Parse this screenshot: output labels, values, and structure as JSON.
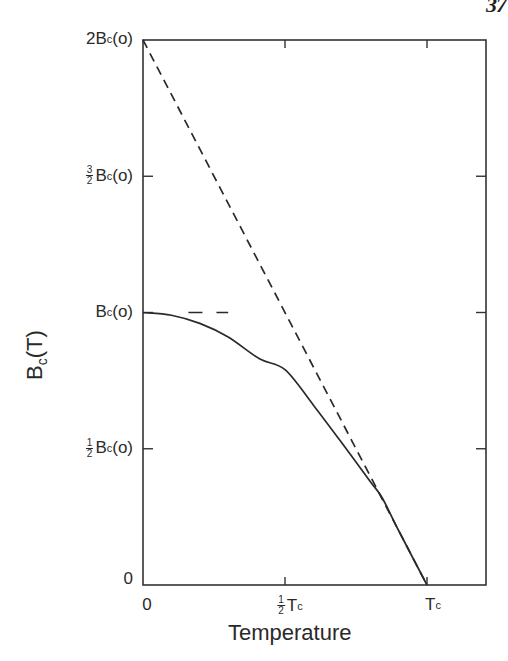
{
  "page": {
    "page_number_partial": "37"
  },
  "chart_data": {
    "type": "line",
    "title": "",
    "xlabel": "Temperature",
    "ylabel": "B_c(T)",
    "ylabel_display": {
      "main": "B",
      "sub": "c",
      "tail": "(T)"
    },
    "x_unit": "T_c",
    "y_unit": "B_c(0)",
    "xlim": [
      0,
      1.2
    ],
    "ylim": [
      0,
      2
    ],
    "grid": false,
    "legend": null,
    "x_ticks": [
      {
        "value": 0,
        "label": "0"
      },
      {
        "value": 0.5,
        "label": "½ T_c",
        "display": {
          "frac_num": "1",
          "frac_den": "2",
          "main": "T",
          "sub": "c"
        }
      },
      {
        "value": 1,
        "label": "T_c",
        "display": {
          "main": "T",
          "sub": "c"
        }
      }
    ],
    "y_ticks": [
      {
        "value": 0,
        "label": "0"
      },
      {
        "value": 0.5,
        "label": "½ B_c(o)",
        "display": {
          "frac_num": "1",
          "frac_den": "2",
          "main": "B",
          "sub": "c",
          "tail": "(o)"
        }
      },
      {
        "value": 1,
        "label": "B_c(o)",
        "display": {
          "main": "B",
          "sub": "c",
          "tail": "(o)"
        }
      },
      {
        "value": 1.5,
        "label": "3/2 B_c(o)",
        "display": {
          "frac_num": "3",
          "frac_den": "2",
          "main": "B",
          "sub": "c",
          "tail": "(o)"
        }
      },
      {
        "value": 2,
        "label": "2B_c(o)",
        "display": {
          "prefix": "2",
          "main": "B",
          "sub": "c",
          "tail": "(o)"
        }
      }
    ],
    "series": [
      {
        "name": "Critical field B_c(T)",
        "style": "solid",
        "x": [
          0,
          0.1,
          0.2,
          0.3,
          0.41,
          0.5,
          0.6,
          0.694,
          0.8,
          0.842,
          0.9,
          1.0
        ],
        "y": [
          1.0,
          0.99,
          0.96,
          0.91,
          0.83,
          0.79,
          0.66,
          0.53,
          0.38,
          0.32,
          0.2,
          0.0
        ]
      },
      {
        "name": "Linear extrapolation of slope at T_c",
        "style": "dashed",
        "x": [
          0,
          1.0
        ],
        "y": [
          2.0,
          0.0
        ]
      },
      {
        "name": "B_c(0) reference",
        "style": "dashed",
        "x": [
          0.16,
          0.3
        ],
        "y": [
          1.0,
          1.0
        ]
      }
    ],
    "colors": {
      "line": "#2a2a2a",
      "axes": "#333333",
      "background": "#ffffff"
    }
  }
}
